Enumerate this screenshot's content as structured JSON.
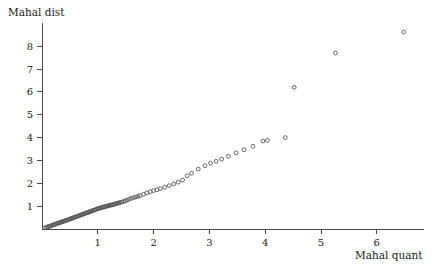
{
  "chart_data": {
    "type": "scatter",
    "title": "",
    "ylabel": "Mahal dist",
    "xlabel": "Mahal quant",
    "xlim": [
      0,
      6.85
    ],
    "ylim": [
      0,
      9.0
    ],
    "grid": false,
    "legend": null,
    "marker": "open-circle",
    "xticks": [
      1,
      2,
      3,
      4,
      5,
      6
    ],
    "xtick_labels": [
      "1",
      "2",
      "3",
      "4",
      "5",
      "6"
    ],
    "yticks": [
      1,
      2,
      3,
      4,
      5,
      6,
      7,
      8
    ],
    "ytick_labels": [
      "1",
      "2",
      "3",
      "4",
      "5",
      "6",
      "7",
      "8"
    ],
    "points": [
      [
        0.05,
        0.05
      ],
      [
        0.08,
        0.07
      ],
      [
        0.1,
        0.09
      ],
      [
        0.12,
        0.11
      ],
      [
        0.14,
        0.12
      ],
      [
        0.16,
        0.14
      ],
      [
        0.18,
        0.16
      ],
      [
        0.2,
        0.18
      ],
      [
        0.22,
        0.19
      ],
      [
        0.24,
        0.21
      ],
      [
        0.26,
        0.23
      ],
      [
        0.28,
        0.25
      ],
      [
        0.3,
        0.26
      ],
      [
        0.32,
        0.28
      ],
      [
        0.34,
        0.3
      ],
      [
        0.36,
        0.31
      ],
      [
        0.38,
        0.33
      ],
      [
        0.4,
        0.35
      ],
      [
        0.42,
        0.37
      ],
      [
        0.44,
        0.38
      ],
      [
        0.46,
        0.4
      ],
      [
        0.48,
        0.42
      ],
      [
        0.5,
        0.44
      ],
      [
        0.52,
        0.45
      ],
      [
        0.54,
        0.47
      ],
      [
        0.56,
        0.49
      ],
      [
        0.58,
        0.51
      ],
      [
        0.6,
        0.53
      ],
      [
        0.62,
        0.54
      ],
      [
        0.64,
        0.56
      ],
      [
        0.66,
        0.58
      ],
      [
        0.68,
        0.6
      ],
      [
        0.7,
        0.62
      ],
      [
        0.72,
        0.63
      ],
      [
        0.74,
        0.65
      ],
      [
        0.76,
        0.67
      ],
      [
        0.78,
        0.69
      ],
      [
        0.8,
        0.71
      ],
      [
        0.82,
        0.72
      ],
      [
        0.84,
        0.74
      ],
      [
        0.86,
        0.76
      ],
      [
        0.88,
        0.78
      ],
      [
        0.9,
        0.8
      ],
      [
        0.92,
        0.81
      ],
      [
        0.94,
        0.83
      ],
      [
        0.96,
        0.85
      ],
      [
        0.98,
        0.87
      ],
      [
        1.0,
        0.89
      ],
      [
        1.02,
        0.9
      ],
      [
        1.04,
        0.92
      ],
      [
        1.06,
        0.93
      ],
      [
        1.08,
        0.95
      ],
      [
        1.1,
        0.96
      ],
      [
        1.12,
        0.97
      ],
      [
        1.14,
        0.99
      ],
      [
        1.16,
        1.0
      ],
      [
        1.18,
        1.01
      ],
      [
        1.2,
        1.02
      ],
      [
        1.22,
        1.04
      ],
      [
        1.24,
        1.05
      ],
      [
        1.26,
        1.06
      ],
      [
        1.28,
        1.07
      ],
      [
        1.3,
        1.09
      ],
      [
        1.32,
        1.1
      ],
      [
        1.34,
        1.12
      ],
      [
        1.36,
        1.13
      ],
      [
        1.38,
        1.15
      ],
      [
        1.4,
        1.16
      ],
      [
        1.43,
        1.18
      ],
      [
        1.46,
        1.2
      ],
      [
        1.49,
        1.23
      ],
      [
        1.52,
        1.26
      ],
      [
        1.56,
        1.3
      ],
      [
        1.6,
        1.34
      ],
      [
        1.64,
        1.37
      ],
      [
        1.68,
        1.4
      ],
      [
        1.72,
        1.43
      ],
      [
        1.76,
        1.46
      ],
      [
        1.82,
        1.52
      ],
      [
        1.88,
        1.58
      ],
      [
        1.94,
        1.63
      ],
      [
        2.0,
        1.68
      ],
      [
        2.06,
        1.72
      ],
      [
        2.12,
        1.77
      ],
      [
        2.2,
        1.83
      ],
      [
        2.28,
        1.9
      ],
      [
        2.36,
        1.97
      ],
      [
        2.44,
        2.05
      ],
      [
        2.52,
        2.14
      ],
      [
        2.6,
        2.33
      ],
      [
        2.68,
        2.44
      ],
      [
        2.8,
        2.62
      ],
      [
        2.92,
        2.77
      ],
      [
        3.02,
        2.88
      ],
      [
        3.12,
        2.96
      ],
      [
        3.22,
        3.06
      ],
      [
        3.34,
        3.18
      ],
      [
        3.48,
        3.33
      ],
      [
        3.62,
        3.47
      ],
      [
        3.78,
        3.62
      ],
      [
        3.96,
        3.85
      ],
      [
        4.04,
        3.88
      ],
      [
        4.36,
        4.0
      ],
      [
        4.52,
        6.2
      ],
      [
        5.26,
        7.7
      ],
      [
        6.48,
        8.62
      ]
    ]
  }
}
